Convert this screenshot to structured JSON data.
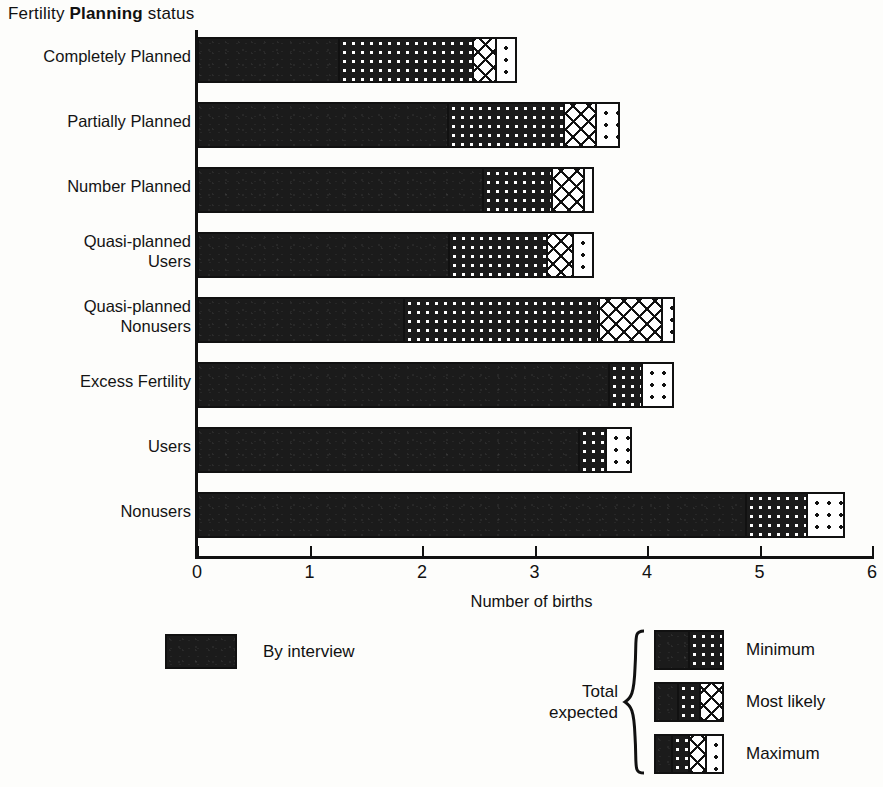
{
  "chart_data": {
    "type": "bar",
    "orientation": "horizontal",
    "stacked": true,
    "title": "Fertility Planning status",
    "title_parts": {
      "plain1": "Fertility ",
      "bold": "Planning",
      "plain2": " status"
    },
    "xlabel": "Number of births",
    "ylabel": "",
    "xlim": [
      0,
      6
    ],
    "xticks": [
      0,
      1,
      2,
      3,
      4,
      5,
      6
    ],
    "xtick_labels": [
      "0",
      "1",
      "2",
      "3",
      "4",
      "5",
      "6"
    ],
    "grid": false,
    "legend_position": "below-plot",
    "categories": [
      "Completely Planned",
      "Partially Planned",
      "Number Planned",
      "Quasi-planned\nUsers",
      "Quasi-planned\nNonusers",
      "Excess Fertility",
      "Users",
      "Nonusers"
    ],
    "series": [
      {
        "name": "By interview",
        "pattern": "solid-black",
        "values": [
          1.25,
          2.22,
          2.53,
          2.23,
          1.83,
          3.65,
          3.39,
          4.87
        ]
      },
      {
        "name": "Minimum",
        "pattern": "dots-on-black",
        "cumulative_values": [
          2.44,
          3.25,
          3.15,
          3.1,
          3.56,
          3.95,
          3.63,
          5.41
        ]
      },
      {
        "name": "Most likely",
        "pattern": "crosshatch",
        "cumulative_values": [
          2.65,
          3.54,
          3.43,
          3.33,
          4.12,
          3.95,
          3.63,
          5.41
        ]
      },
      {
        "name": "Maximum",
        "pattern": "light-dots",
        "cumulative_values": [
          2.84,
          3.76,
          3.53,
          3.53,
          4.25,
          4.24,
          3.87,
          5.76
        ]
      }
    ],
    "bars": [
      {
        "category": "Completely Planned",
        "interview": 1.25,
        "minimum": 2.44,
        "most_likely": 2.65,
        "maximum": 2.84
      },
      {
        "category": "Partially Planned",
        "interview": 2.22,
        "minimum": 3.25,
        "most_likely": 3.54,
        "maximum": 3.76
      },
      {
        "category": "Number Planned",
        "interview": 2.53,
        "minimum": 3.15,
        "most_likely": 3.43,
        "maximum": 3.53
      },
      {
        "category": "Quasi-planned Users",
        "interview": 2.23,
        "minimum": 3.1,
        "most_likely": 3.33,
        "maximum": 3.53
      },
      {
        "category": "Quasi-planned Nonusers",
        "interview": 1.83,
        "minimum": 3.56,
        "most_likely": 4.12,
        "maximum": 4.25
      },
      {
        "category": "Excess Fertility",
        "interview": 3.65,
        "minimum": 3.95,
        "most_likely": 3.95,
        "maximum": 4.24
      },
      {
        "category": "Users",
        "interview": 3.39,
        "minimum": 3.63,
        "most_likely": 3.63,
        "maximum": 3.87
      },
      {
        "category": "Nonusers",
        "interview": 4.87,
        "minimum": 5.41,
        "most_likely": 5.41,
        "maximum": 5.76
      }
    ],
    "annotations": []
  },
  "legend": {
    "interview": {
      "label": "By interview",
      "swatch": "solid-black"
    },
    "total_group_label": "Total\nexpected",
    "items": [
      {
        "label": "Minimum",
        "patterns": [
          "solid-black",
          "dots-on-black"
        ]
      },
      {
        "label": "Most likely",
        "patterns": [
          "solid-black",
          "dots-on-black",
          "crosshatch"
        ]
      },
      {
        "label": "Maximum",
        "patterns": [
          "solid-black",
          "dots-on-black",
          "crosshatch",
          "light-dots"
        ]
      }
    ]
  },
  "colors": {
    "ink": "#111111",
    "paper": "#fdfdfb",
    "bar_fill": "#1b1b1b"
  }
}
